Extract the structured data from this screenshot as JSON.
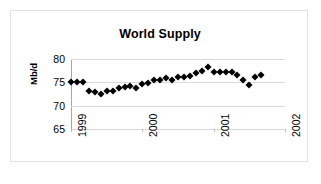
{
  "chart_data": {
    "type": "scatter",
    "title": "World Supply",
    "xlabel": "",
    "ylabel": "Mb/d",
    "ylim": [
      65,
      80
    ],
    "yticks": [
      65,
      70,
      75,
      80
    ],
    "grid": true,
    "legend": false,
    "xtick_labels": [
      "1999",
      "2000",
      "2001",
      "2002"
    ],
    "xtick_values": [
      1999,
      2000,
      2001,
      2002
    ],
    "xlim": [
      1999,
      2002
    ],
    "marker": "diamond",
    "marker_color": "#000000",
    "series": [
      {
        "name": "World Supply",
        "x": [
          1999.0,
          1999.083,
          1999.167,
          1999.25,
          1999.333,
          1999.417,
          1999.5,
          1999.583,
          1999.667,
          1999.75,
          1999.833,
          1999.917,
          2000.0,
          2000.083,
          2000.167,
          2000.25,
          2000.333,
          2000.417,
          2000.5,
          2000.583,
          2000.667,
          2000.75,
          2000.833,
          2000.917,
          2001.0,
          2001.083,
          2001.167,
          2001.25,
          2001.333,
          2001.417,
          2001.5,
          2001.583,
          2001.667
        ],
        "values": [
          75.0,
          75.0,
          75.0,
          73.1,
          73.0,
          72.4,
          73.1,
          73.2,
          73.8,
          73.9,
          74.2,
          73.8,
          74.6,
          74.8,
          75.6,
          75.4,
          75.9,
          75.5,
          76.2,
          76.2,
          76.4,
          76.9,
          77.4,
          78.2,
          77.3,
          77.3,
          77.3,
          77.2,
          76.6,
          75.4,
          74.4,
          76.2,
          76.6
        ]
      }
    ]
  }
}
